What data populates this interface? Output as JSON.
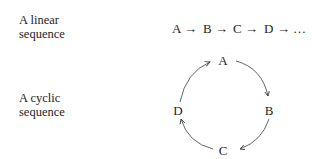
{
  "labels": {
    "linear": [
      "A linear",
      "sequence"
    ],
    "cyclic": [
      "A cyclic",
      "sequence"
    ]
  },
  "linear_sequence": {
    "items": [
      "A",
      "B",
      "C",
      "D",
      "…"
    ],
    "connector": "→"
  },
  "cyclic_sequence": {
    "nodes": [
      "A",
      "B",
      "C",
      "D"
    ],
    "direction": "clockwise"
  }
}
